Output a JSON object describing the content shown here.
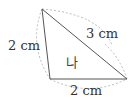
{
  "diagram": {
    "shape": "triangle",
    "name": "나",
    "vertices": {
      "top": [
        42,
        9
      ],
      "bottom_left": [
        50,
        79
      ],
      "bottom_right": [
        127,
        79
      ]
    },
    "sides": [
      {
        "id": "left",
        "label": "2 cm"
      },
      {
        "id": "hypotenuse",
        "label": "3 cm"
      },
      {
        "id": "bottom",
        "label": "2 cm"
      }
    ],
    "colors": {
      "line": "#555555",
      "arc": "#bbbbbb",
      "text": "#333333"
    }
  }
}
